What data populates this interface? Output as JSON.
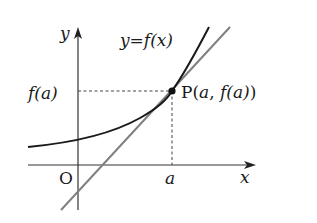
{
  "diagram": {
    "type": "tangent-line-graph",
    "colors": {
      "curve": "#1a1a1a",
      "tangent": "#808080",
      "axes": "#333333",
      "guides": "#444444",
      "background": "#ffffff"
    },
    "labels": {
      "y_axis": "y",
      "x_axis": "x",
      "origin": "O",
      "curve_label_lhs": "y",
      "curve_label_eq": "=",
      "curve_label_rhs": "f(x)",
      "fa_label": "f(a)",
      "a_label": "a",
      "point_P": "P",
      "point_coords_open": "(",
      "point_coords_a": "a",
      "point_coords_sep": ", ",
      "point_coords_fa": "f(a)",
      "point_coords_close": ")"
    },
    "elements": {
      "curve": "exponential-like increasing curve y=f(x)",
      "tangent_line": "tangent to curve at P",
      "point": "P(a, f(a))",
      "dashed_guides": [
        "horizontal from y-axis at f(a) to P",
        "vertical from P down to x-axis at a"
      ]
    }
  }
}
